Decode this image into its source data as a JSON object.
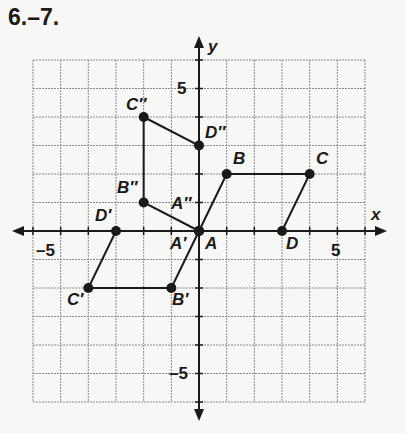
{
  "title": "6.–7.",
  "axes": {
    "x_label": "x",
    "y_label": "y",
    "x_range": [
      -6,
      6
    ],
    "y_range": [
      -6,
      6
    ],
    "tick_labels": {
      "x_neg": "–5",
      "x_pos": "5",
      "y_pos": "5",
      "y_neg": "–5"
    }
  },
  "figures": [
    {
      "name": "ABCD",
      "points": [
        {
          "label": "A",
          "x": 0,
          "y": 0
        },
        {
          "label": "B",
          "x": 1,
          "y": 2
        },
        {
          "label": "C",
          "x": 4,
          "y": 2
        },
        {
          "label": "D",
          "x": 3,
          "y": 0
        }
      ]
    },
    {
      "name": "A'B'C'D'",
      "points": [
        {
          "label": "A′",
          "x": 0,
          "y": 0
        },
        {
          "label": "B′",
          "x": -1,
          "y": -2
        },
        {
          "label": "C′",
          "x": -4,
          "y": -2
        },
        {
          "label": "D′",
          "x": -3,
          "y": 0
        }
      ]
    },
    {
      "name": "A''B''C''D''",
      "points": [
        {
          "label": "A″",
          "x": 0,
          "y": 0
        },
        {
          "label": "B″",
          "x": -2,
          "y": 1
        },
        {
          "label": "C″",
          "x": -2,
          "y": 4
        },
        {
          "label": "D″",
          "x": 0,
          "y": 3
        }
      ]
    }
  ],
  "colors": {
    "grid": "#8a8a8a",
    "ink": "#1a1a1a",
    "background": "#f7f7f5"
  }
}
